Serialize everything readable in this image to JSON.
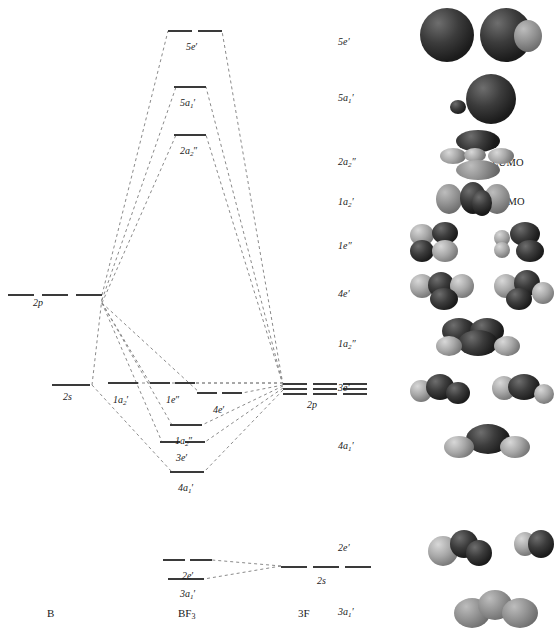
{
  "figure": {
    "type": "mo-correlation-diagram"
  },
  "axis_labels": {
    "left": "B",
    "center": "BF",
    "center_sub": "3",
    "right": "3F"
  },
  "annotations": [
    {
      "id": "lumo",
      "text": "LUMO",
      "x": 492,
      "y": 157
    },
    {
      "id": "homo",
      "text": "HOMO",
      "x": 492,
      "y": 196
    }
  ],
  "fragment_levels": {
    "boron": [
      {
        "id": "b-2p",
        "label": "2p",
        "label_x": 33,
        "label_y": 298,
        "y": 294,
        "segments": [
          {
            "x": 8,
            "w": 26
          },
          {
            "x": 42,
            "w": 26
          },
          {
            "x": 76,
            "w": 26
          }
        ]
      },
      {
        "id": "b-2s",
        "label": "2s",
        "label_x": 63,
        "label_y": 392,
        "y": 384,
        "segments": [
          {
            "x": 52,
            "w": 38
          }
        ]
      }
    ],
    "fluorine": [
      {
        "id": "f-2p",
        "label": "2p",
        "label_x": 307,
        "label_y": 400,
        "y": 383,
        "groups": [
          {
            "x": 283,
            "w": 24
          },
          {
            "x": 313,
            "w": 24
          },
          {
            "x": 343,
            "w": 24
          }
        ],
        "lines_per_group": 3,
        "line_gap": 5
      },
      {
        "id": "f-2s",
        "label": "2s",
        "label_x": 317,
        "label_y": 576,
        "y": 566,
        "segments": [
          {
            "x": 281,
            "w": 26
          },
          {
            "x": 313,
            "w": 26
          },
          {
            "x": 345,
            "w": 26
          }
        ]
      }
    ]
  },
  "mo_levels": [
    {
      "id": "5e-prime",
      "label": "5e",
      "prime": "′",
      "sub": "",
      "label_x": 186,
      "label_y": 42,
      "y": 30,
      "segments": [
        {
          "x": 168,
          "w": 24
        },
        {
          "x": 198,
          "w": 24
        }
      ]
    },
    {
      "id": "5a1-prime",
      "label": "5a",
      "prime": "′",
      "sub": "1",
      "label_x": 180,
      "label_y": 98,
      "y": 86,
      "segments": [
        {
          "x": 174,
          "w": 32
        }
      ]
    },
    {
      "id": "2a2-dprime",
      "label": "2a",
      "prime": "″",
      "sub": "2",
      "label_x": 180,
      "label_y": 146,
      "y": 134,
      "segments": [
        {
          "x": 174,
          "w": 32
        }
      ]
    },
    {
      "id": "1a2-prime",
      "label": "1a",
      "prime": "′",
      "sub": "2",
      "label_x": 113,
      "label_y": 395,
      "y": 382,
      "segments": [
        {
          "x": 108,
          "w": 30
        }
      ]
    },
    {
      "id": "1e-dprime",
      "label": "1e",
      "prime": "″",
      "sub": "",
      "label_x": 166,
      "label_y": 395,
      "y": 382,
      "segments": [
        {
          "x": 150,
          "w": 20
        },
        {
          "x": 175,
          "w": 20
        }
      ]
    },
    {
      "id": "4e-prime",
      "label": "4e",
      "prime": "′",
      "sub": "",
      "label_x": 213,
      "label_y": 405,
      "y": 392,
      "segments": [
        {
          "x": 197,
          "w": 20
        },
        {
          "x": 222,
          "w": 20
        }
      ]
    },
    {
      "id": "1a2-dprime",
      "label": "1a",
      "prime": "″",
      "sub": "2",
      "label_x": 175,
      "label_y": 436,
      "y": 424,
      "segments": [
        {
          "x": 170,
          "w": 32
        }
      ]
    },
    {
      "id": "3e-prime",
      "label": "3e",
      "prime": "′",
      "sub": "",
      "label_x": 176,
      "label_y": 453,
      "y": 441,
      "segments": [
        {
          "x": 160,
          "w": 20
        },
        {
          "x": 185,
          "w": 20
        }
      ]
    },
    {
      "id": "4a1-prime",
      "label": "4a",
      "prime": "′",
      "sub": "1",
      "label_x": 178,
      "label_y": 483,
      "y": 471,
      "segments": [
        {
          "x": 170,
          "w": 34
        }
      ]
    },
    {
      "id": "2e-prime",
      "label": "2e",
      "prime": "′",
      "sub": "",
      "label_x": 182,
      "label_y": 571,
      "y": 559,
      "segments": [
        {
          "x": 163,
          "w": 22
        },
        {
          "x": 190,
          "w": 22
        }
      ]
    },
    {
      "id": "3a1-prime",
      "label": "3a",
      "prime": "′",
      "sub": "1",
      "label_x": 180,
      "label_y": 589,
      "y": 578,
      "segments": [
        {
          "x": 168,
          "w": 36
        }
      ]
    }
  ],
  "orbital_labels": [
    {
      "id": "row-5e-prime",
      "label": "5e",
      "prime": "′",
      "sub": "",
      "x": 338,
      "y": 36
    },
    {
      "id": "row-5a1-prime",
      "label": "5a",
      "prime": "′",
      "sub": "1",
      "x": 338,
      "y": 92
    },
    {
      "id": "row-2a2-dprime",
      "label": "2a",
      "prime": "″",
      "sub": "2",
      "x": 338,
      "y": 156
    },
    {
      "id": "row-1a2-prime",
      "label": "1a",
      "prime": "′",
      "sub": "2",
      "x": 338,
      "y": 196
    },
    {
      "id": "row-1e-dprime",
      "label": "1e",
      "prime": "″",
      "sub": "",
      "x": 338,
      "y": 240
    },
    {
      "id": "row-4e-prime",
      "label": "4e",
      "prime": "′",
      "sub": "",
      "x": 338,
      "y": 288
    },
    {
      "id": "row-1a2-dprime",
      "label": "1a",
      "prime": "″",
      "sub": "2",
      "x": 338,
      "y": 338
    },
    {
      "id": "row-3e-prime",
      "label": "3e",
      "prime": "′",
      "sub": "",
      "x": 338,
      "y": 382
    },
    {
      "id": "row-4a1-prime",
      "label": "4a",
      "prime": "′",
      "sub": "1",
      "x": 338,
      "y": 440
    },
    {
      "id": "row-2e-prime",
      "label": "2e",
      "prime": "′",
      "sub": "",
      "x": 338,
      "y": 542
    },
    {
      "id": "row-3a1-prime",
      "label": "3a",
      "prime": "′",
      "sub": "1",
      "x": 338,
      "y": 606
    }
  ],
  "colors": {
    "level_line": "#3a3a3a",
    "correlation_line": "#7a7a7a",
    "text": "#1a1a1a",
    "lobe_dark": "#2a2a2a",
    "lobe_light": "#a8a8a8",
    "background": "#ffffff"
  },
  "correlations": {
    "style": "dashed",
    "dash": "3,3",
    "from_boron_2p": [
      "5e-prime",
      "5a1-prime",
      "2a2-dprime",
      "1e-dprime",
      "1a2-dprime",
      "3e-prime",
      "4e-prime"
    ],
    "from_boron_2s": [
      "5a1-prime",
      "4a1-prime"
    ],
    "from_fluorine_2p": [
      "5e-prime",
      "5a1-prime",
      "2a2-dprime",
      "1a2-prime",
      "1e-dprime",
      "4e-prime",
      "1a2-dprime",
      "3e-prime",
      "4a1-prime"
    ],
    "from_fluorine_2s": [
      "2e-prime",
      "3a1-prime"
    ]
  }
}
